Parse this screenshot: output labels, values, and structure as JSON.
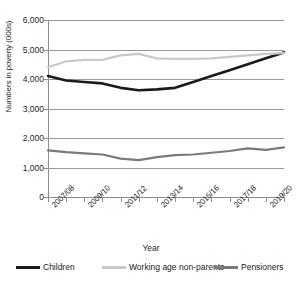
{
  "chart_data": {
    "type": "line",
    "title": "",
    "xlabel": "Year",
    "ylabel": "Numbers in poverty (000s)",
    "ylim": [
      0,
      6000
    ],
    "ytick_labels": [
      "6,000",
      "5,000",
      "4,000",
      "3,000",
      "2,000",
      "1,000",
      "0"
    ],
    "ytick_values": [
      6000,
      5000,
      4000,
      3000,
      2000,
      1000,
      0
    ],
    "grid": true,
    "legend_position": "bottom",
    "categories": [
      "2007/08",
      "2008/09",
      "2009/10",
      "2010/11",
      "2011/12",
      "2012/13",
      "2013/14",
      "2014/15",
      "2015/16",
      "2016/17",
      "2017/18",
      "2018/19",
      "2019/20",
      "2020/21"
    ],
    "xtick_labels": [
      "2007/08",
      "2009/10",
      "2011/12",
      "2013/14",
      "2015/16",
      "2017/18",
      "2019/20"
    ],
    "series": [
      {
        "name": "Children",
        "color": "#1a1a1a",
        "values": [
          4100,
          3950,
          3900,
          3850,
          3700,
          3620,
          3650,
          3700,
          3900,
          4100,
          4300,
          4500,
          4700,
          4900
        ]
      },
      {
        "name": "Working age non-parents",
        "color": "#c9c9c9",
        "values": [
          4400,
          4600,
          4650,
          4650,
          4800,
          4850,
          4700,
          4680,
          4680,
          4700,
          4750,
          4800,
          4850,
          4880
        ]
      },
      {
        "name": "Pensioners",
        "color": "#7a7a7a",
        "values": [
          1580,
          1520,
          1480,
          1440,
          1300,
          1250,
          1350,
          1420,
          1440,
          1500,
          1560,
          1650,
          1600,
          1680
        ]
      }
    ]
  }
}
